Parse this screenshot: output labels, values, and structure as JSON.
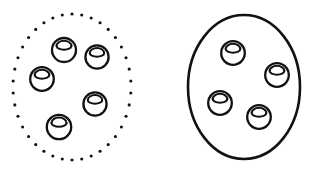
{
  "figure": {
    "type": "set-comparison-diagram",
    "background_color": "#ffffff",
    "ink_color": "#111111",
    "canvas": {
      "width": 318,
      "height": 174
    }
  },
  "groups": [
    {
      "id": "left-group",
      "name": "dotted-boundary-group",
      "boundary": {
        "shape": "ellipse",
        "style": "dotted",
        "stroke_color": "#111111",
        "stroke_width": 2.6,
        "dot_count": 38,
        "cx": 72,
        "cy": 87,
        "rx": 59,
        "ry": 73
      },
      "item_count": 5,
      "items": [
        {
          "label": "token-1",
          "cx": 64,
          "cy": 50,
          "r": 12.0
        },
        {
          "label": "token-2",
          "cx": 97,
          "cy": 57,
          "r": 11.6
        },
        {
          "label": "token-3",
          "cx": 42,
          "cy": 79,
          "r": 11.8
        },
        {
          "label": "token-4",
          "cx": 95,
          "cy": 104,
          "r": 11.6
        },
        {
          "label": "token-5",
          "cx": 59,
          "cy": 127,
          "r": 12.2
        }
      ]
    },
    {
      "id": "right-group",
      "name": "solid-boundary-group",
      "boundary": {
        "shape": "ellipse",
        "style": "solid",
        "stroke_color": "#111111",
        "stroke_width": 2.6,
        "dot_count": 0,
        "cx": 244,
        "cy": 87,
        "rx": 56,
        "ry": 72
      },
      "item_count": 4,
      "items": [
        {
          "label": "token-1",
          "cx": 233,
          "cy": 53,
          "r": 11.8
        },
        {
          "label": "token-2",
          "cx": 277,
          "cy": 75,
          "r": 11.8
        },
        {
          "label": "token-3",
          "cx": 220,
          "cy": 103,
          "r": 11.8
        },
        {
          "label": "token-4",
          "cx": 259,
          "cy": 117,
          "r": 11.8
        }
      ]
    }
  ],
  "token_style": {
    "name": "ball-with-cap",
    "description": "outlined circle with an elliptical cap arc near the top",
    "stroke_color": "#111111",
    "body_stroke_width": 2.3,
    "cap_stroke_width": 2.0,
    "fill": "#ffffff",
    "cap_offset_ratio": -0.33,
    "cap_rx_ratio": 0.62,
    "cap_ry_ratio": 0.3
  }
}
